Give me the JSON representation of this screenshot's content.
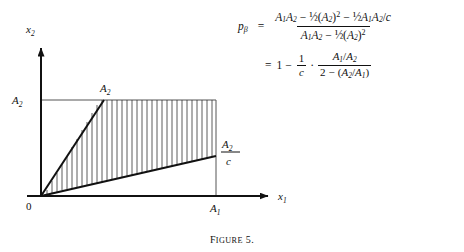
{
  "figure": {
    "caption_prefix": "F",
    "caption_rest": "IGURE",
    "caption_number": "5."
  },
  "plot": {
    "y_axis_label": "x",
    "y_axis_label_sub": "2",
    "x_axis_label": "x",
    "x_axis_label_sub": "1",
    "origin_label": "0",
    "y_tick_label": "A",
    "y_tick_label_sub": "2",
    "x_tick_label": "A",
    "x_tick_label_sub": "1",
    "upper_point_label": "A",
    "upper_point_label_sub": "2",
    "right_fraction_numerator": "A",
    "right_fraction_numerator_sub": "2",
    "right_fraction_denominator": "c",
    "hatch_line_count": 31,
    "colors": {
      "ink": "#111111",
      "thin_rule": "#555555",
      "hatch": "#333333"
    }
  },
  "equation": {
    "line1": {
      "lhs_symbol": "p",
      "lhs_subscript": "β",
      "equals": "=",
      "numerator": {
        "t1_A": "A",
        "t1_sub1": "1",
        "t1_A2": "A",
        "t1_sub2": "2",
        "op1": "−",
        "half1": "½",
        "paren1_open": "(",
        "paren1_A": "A",
        "paren1_sub": "2",
        "paren1_close": ")",
        "paren1_exp": "2",
        "op2": "−",
        "half2": "½",
        "t3_A1": "A",
        "t3_sub1": "1",
        "t3_A2": "A",
        "t3_sub2": "2",
        "t3_slash": "/",
        "t3_c": "c"
      },
      "denominator": {
        "d1_A": "A",
        "d1_sub1": "1",
        "d1_A2": "A",
        "d1_sub2": "2",
        "op1": "−",
        "half1": "½",
        "paren_open": "(",
        "paren_A": "A",
        "paren_sub": "2",
        "paren_close": ")",
        "paren_exp": "2"
      }
    },
    "line2": {
      "equals": "=",
      "one": "1",
      "minus": "−",
      "frac1_num": "1",
      "frac1_den": "c",
      "multiply": "·",
      "frac2_num_A1": "A",
      "frac2_num_sub1": "1",
      "frac2_num_slash": "/",
      "frac2_num_A2": "A",
      "frac2_num_sub2": "2",
      "frac2_den_two": "2",
      "frac2_den_minus": "−",
      "frac2_den_open": "(",
      "frac2_den_A2": "A",
      "frac2_den_sub2": "2",
      "frac2_den_slash": "/",
      "frac2_den_A1": "A",
      "frac2_den_sub1": "1",
      "frac2_den_close": ")"
    }
  }
}
